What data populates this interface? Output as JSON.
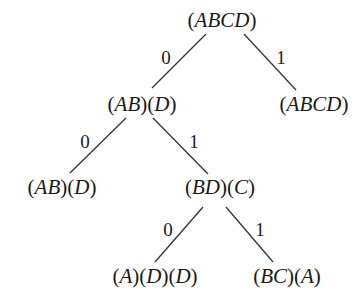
{
  "diagram": {
    "type": "binary-tree",
    "nodes": [
      {
        "id": "root",
        "label": "(ABCD)",
        "x": 222,
        "y": 27
      },
      {
        "id": "n0",
        "label": "(AB)(D)",
        "x": 142,
        "y": 111
      },
      {
        "id": "n1",
        "label": "(ABCD)",
        "x": 314,
        "y": 111
      },
      {
        "id": "n00",
        "label": "(AB)(D)",
        "x": 62,
        "y": 194
      },
      {
        "id": "n01",
        "label": "(BD)(C)",
        "x": 220,
        "y": 194
      },
      {
        "id": "n010",
        "label": "(A)(D)(D)",
        "x": 155,
        "y": 283
      },
      {
        "id": "n011",
        "label": "(BC)(A)",
        "x": 287,
        "y": 283
      }
    ],
    "edges": [
      {
        "from": "root",
        "to": "n0",
        "label": "0",
        "x1": 206,
        "y1": 34,
        "x2": 152,
        "y2": 88,
        "lx": 166,
        "ly": 64
      },
      {
        "from": "root",
        "to": "n1",
        "label": "1",
        "x1": 244,
        "y1": 34,
        "x2": 296,
        "y2": 90,
        "lx": 281,
        "ly": 64
      },
      {
        "from": "n0",
        "to": "n00",
        "label": "0",
        "x1": 126,
        "y1": 118,
        "x2": 70,
        "y2": 173,
        "lx": 85,
        "ly": 148
      },
      {
        "from": "n0",
        "to": "n01",
        "label": "1",
        "x1": 153,
        "y1": 118,
        "x2": 208,
        "y2": 174,
        "lx": 194,
        "ly": 148
      },
      {
        "from": "n01",
        "to": "n010",
        "label": "0",
        "x1": 203,
        "y1": 207,
        "x2": 155,
        "y2": 262,
        "lx": 168,
        "ly": 236
      },
      {
        "from": "n01",
        "to": "n011",
        "label": "1",
        "x1": 226,
        "y1": 207,
        "x2": 273,
        "y2": 262,
        "lx": 260,
        "ly": 236
      }
    ]
  }
}
